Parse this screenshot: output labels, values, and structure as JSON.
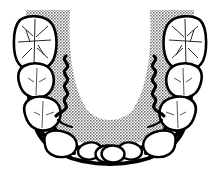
{
  "figure": {
    "title": "Dental Arch Diagram",
    "view": "occlusal",
    "background_color": "#ffffff",
    "outline_color": "#000000",
    "tissue_shade_color": "#808080",
    "tooth_fill_color": "#ffffff",
    "halftone_pattern": "dot-screen-50",
    "canvas": {
      "width": 220,
      "height": 177
    }
  },
  "regions": {
    "tissue": {
      "name": "gingival-tissue-shading",
      "fill": "#808080",
      "pattern": "halftone-dots",
      "description": "U-shaped halftone shaded band following the arch"
    },
    "tongue_space": {
      "name": "central-tongue-space",
      "fill": "#ffffff",
      "description": "White U-shaped open area at the center of the arch"
    },
    "arch_border": {
      "name": "denture-border-outline",
      "stroke": "#000000",
      "stroke_width": 4
    }
  },
  "markings": {
    "wavy_lines": [
      {
        "name": "wavy-line-left",
        "side": "left",
        "style": "zigzag-vertical"
      },
      {
        "name": "wavy-line-right",
        "side": "right",
        "style": "zigzag-vertical"
      }
    ],
    "occlusal_anatomy": "cusp-and-fissure-lines"
  },
  "teeth": {
    "left": [
      {
        "position": 1,
        "type": "molar",
        "label": "left-molar",
        "has_occlusal_detail": true
      },
      {
        "position": 2,
        "type": "premolar",
        "label": "left-second-premolar",
        "has_occlusal_detail": true
      },
      {
        "position": 3,
        "type": "premolar",
        "label": "left-first-premolar",
        "has_occlusal_detail": true
      },
      {
        "position": 4,
        "type": "canine",
        "label": "left-canine",
        "has_occlusal_detail": false
      },
      {
        "position": 5,
        "type": "incisor",
        "label": "left-lateral-incisor",
        "has_occlusal_detail": false
      },
      {
        "position": 6,
        "type": "incisor",
        "label": "left-central-incisor",
        "has_occlusal_detail": false
      }
    ],
    "right": [
      {
        "position": 1,
        "type": "molar",
        "label": "right-molar",
        "has_occlusal_detail": true
      },
      {
        "position": 2,
        "type": "premolar",
        "label": "right-second-premolar",
        "has_occlusal_detail": true
      },
      {
        "position": 3,
        "type": "premolar",
        "label": "right-first-premolar",
        "has_occlusal_detail": true
      },
      {
        "position": 4,
        "type": "canine",
        "label": "right-canine",
        "has_occlusal_detail": false
      },
      {
        "position": 5,
        "type": "incisor",
        "label": "right-lateral-incisor",
        "has_occlusal_detail": false
      },
      {
        "position": 6,
        "type": "incisor",
        "label": "right-central-incisor",
        "has_occlusal_detail": false
      }
    ],
    "total_count": 12
  }
}
